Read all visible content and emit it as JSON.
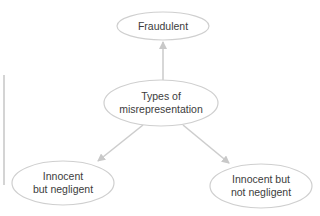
{
  "diagram": {
    "colors": {
      "stroke": "#cfcfcf",
      "arrow": "#c8c8c8",
      "text": "#3c3c3c",
      "background": "#ffffff"
    },
    "nodes": [
      {
        "id": "center",
        "lines": [
          "Types of",
          "misrepresentation"
        ],
        "cx": 161,
        "cy": 103,
        "rx": 57,
        "ry": 23
      },
      {
        "id": "fraudulent",
        "lines": [
          "Fraudulent"
        ],
        "cx": 163,
        "cy": 26,
        "rx": 46,
        "ry": 14
      },
      {
        "id": "innocent-negligent",
        "lines": [
          "Innocent",
          "but negligent"
        ],
        "cx": 63,
        "cy": 183,
        "rx": 51,
        "ry": 22
      },
      {
        "id": "innocent-not-negligent",
        "lines": [
          "Innocent but",
          "not negligent"
        ],
        "cx": 261,
        "cy": 186,
        "rx": 51,
        "ry": 22
      }
    ],
    "edges": [
      {
        "from": "center",
        "to": "fraudulent",
        "x1": 163,
        "y1": 80,
        "x2": 163,
        "y2": 42
      },
      {
        "from": "center",
        "to": "innocent-negligent",
        "x1": 143,
        "y1": 125,
        "x2": 98,
        "y2": 161
      },
      {
        "from": "center",
        "to": "innocent-not-negligent",
        "x1": 183,
        "y1": 125,
        "x2": 229,
        "y2": 163
      }
    ],
    "labels": {
      "center_line1": "Types of",
      "center_line2": "misrepresentation",
      "fraudulent": "Fraudulent",
      "left_line1": "Innocent",
      "left_line2": "but negligent",
      "right_line1": "Innocent but",
      "right_line2": "not negligent"
    }
  }
}
